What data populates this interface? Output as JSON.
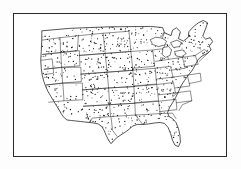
{
  "figure": {
    "title": "Dot density map of the contiguous United States",
    "style": "black-and-white line engraving",
    "background_color": "#ffffff",
    "ink_color": "#1a1a1a",
    "frame": {
      "present": true,
      "border_color": "#2b2b2b",
      "border_width_px": 1.3,
      "x": 13,
      "y": 13,
      "width": 214,
      "height": 144
    }
  },
  "map": {
    "region": "Contiguous United States (lower 48)",
    "projection_hint": "Albers-like conic",
    "features": {
      "state_boundaries": true,
      "national_outline": true,
      "great_lakes": true,
      "dot_density_fill": true,
      "labels": false,
      "legend": false,
      "scale_bar": false,
      "compass_rose": false
    },
    "dot_symbol": {
      "shape": "dot",
      "radius_px": 0.55,
      "color": "#1a1a1a",
      "approx_count": 1180,
      "distribution": "roughly uniform scatter within land area"
    },
    "outline_color": "#1a1a1a",
    "outline_width_px": 0.7,
    "state_line_width_px": 0.5,
    "nation_outline_path": "M 28.5 17.0 L 57.0 14.5 L 96.0 13.0 L 138.0 12.6 L 150.0 13.8 L 152.0 19.0 L 158.5 22.0 L 160.0 16.5 L 164.0 14.0 L 168.0 18.0 L 166.0 25.0 L 171.0 27.5 L 176.0 23.5 L 176.5 18.0 L 181.0 13.0 L 186.0 9.0 L 191.0 6.5 L 195.5 9.0 L 193.0 16.0 L 190.5 22.5 L 193.5 25.5 L 198.0 24.0 L 200.5 28.0 L 197.0 32.5 L 199.0 36.5 L 195.0 40.0 L 190.0 42.5 L 186.0 46.0 L 183.0 51.5 L 180.0 57.0 L 176.0 62.0 L 172.0 67.5 L 168.5 73.0 L 166.0 79.0 L 163.0 85.0 L 160.0 90.0 L 157.0 95.0 L 155.0 100.0 L 156.5 104.0 L 160.0 106.0 L 163.5 110.0 L 166.0 116.0 L 167.5 123.0 L 168.0 130.0 L 166.0 134.5 L 162.5 133.0 L 160.0 128.0 L 158.0 121.0 L 155.5 115.0 L 152.0 111.0 L 147.5 110.0 L 142.0 110.5 L 136.0 111.5 L 130.0 112.0 L 124.5 112.0 L 120.0 113.5 L 116.0 117.0 L 112.0 120.0 L 108.0 122.5 L 104.5 125.0 L 101.0 128.0 L 98.0 131.5 L 95.5 128.0 L 93.0 123.0 L 91.0 118.0 L 88.5 114.0 L 85.0 111.5 L 80.5 110.5 L 76.0 110.0 L 71.5 109.5 L 67.0 109.0 L 62.5 108.5 L 58.0 108.0 L 53.5 107.5 L 49.5 104.0 L 46.5 99.0 L 43.5 94.0 L 40.5 89.0 L 37.5 84.0 L 34.5 79.0 L 32.0 73.5 L 30.0 68.0 L 28.5 62.0 L 27.5 55.0 L 27.0 47.0 L 27.5 38.0 L 28.0 27.0 Z",
    "state_lines": [
      "M 28.2 26.5 L 46.5 24.0 L 47.0 39.0 L 29.0 41.0",
      "M 47.0 39.0 L 64.0 37.0 L 65.0 22.0 L 46.5 24.0",
      "M 29.0 41.0 L 47.3 39.2 L 48.0 54.0 L 30.5 56.0",
      "M 48.0 54.0 L 66.5 52.5 L 66.0 37.2 L 47.3 39.2",
      "M 65.0 22.0 L 90.0 19.5 L 92.0 40.0 L 66.0 42.0",
      "M 90.0 19.5 L 116.0 17.5 L 118.0 38.0 L 92.0 40.0",
      "M 92.0 40.0 L 118.0 38.0 L 120.0 57.0 L 94.0 59.0",
      "M 66.0 42.0 L 92.0 40.0 L 94.0 59.0 L 67.5 61.0",
      "M 30.5 56.0 L 48.2 54.2 L 49.0 70.0 L 32.5 72.0",
      "M 49.0 70.0 L 68.0 68.5 L 67.5 54.0 L 48.2 54.2",
      "M 67.5 61.0 L 94.0 59.0 L 95.5 75.0 L 69.0 77.0",
      "M 95.5 75.0 L 121.0 73.5 L 120.0 57.2 L 94.0 59.0",
      "M 32.5 72.0 L 49.3 70.2 L 50.5 88.0 L 35.0 89.5",
      "M 50.5 88.0 L 69.5 87.0 L 69.0 70.0 L 49.3 70.2",
      "M 69.0 77.0 L 95.5 75.0 L 96.5 92.0 L 70.0 93.5",
      "M 96.5 92.0 L 122.0 90.5 L 121.0 73.7 L 95.5 75.0",
      "M 70.0 93.5 L 96.5 92.0 L 97.5 104.0 L 79.0 105.5 L 76.0 110.0",
      "M 97.5 104.0 L 122.5 102.5 L 122.0 90.5 L 96.5 92.0",
      "M 118.0 38.0 L 140.0 36.5 L 142.0 53.0 L 120.0 55.0",
      "M 120.0 57.0 L 142.5 55.0 L 144.0 71.0 L 121.0 73.0",
      "M 121.0 73.5 L 144.0 71.5 L 146.0 88.0 L 122.0 90.0",
      "M 122.0 90.5 L 146.0 88.5 L 147.5 101.0 L 122.5 102.5",
      "M 140.0 36.5 L 152.0 35.0 L 156.0 46.0 L 143.0 48.0",
      "M 142.5 55.0 L 158.0 53.0 L 160.5 64.0 L 144.0 66.0",
      "M 144.0 71.5 L 161.0 69.5 L 163.0 80.0 L 146.0 82.0",
      "M 146.0 88.5 L 163.5 86.5 L 164.5 97.0 L 147.0 99.0",
      "M 156.0 46.0 L 170.0 44.0 L 173.0 55.0 L 158.5 57.0",
      "M 160.5 64.0 L 175.0 62.0 L 177.5 73.0 L 162.5 75.0",
      "M 163.0 80.0 L 178.0 78.0 L 179.5 88.0 L 164.0 90.0",
      "M 170.0 44.0 L 183.0 42.0 L 186.0 51.0 L 172.0 53.5",
      "M 175.0 62.0 L 188.0 60.0 L 189.0 68.0 L 177.0 70.5",
      "M 183.0 42.0 L 192.0 36.0 L 196.5 39.0 L 187.0 48.0",
      "M 147.5 101.0 L 160.0 100.5 L 163.5 106.0",
      "M 98.0 105.0 L 99.5 118.0 L 104.0 124.0",
      "M 122.5 102.5 L 130.0 112.0",
      "M 152.0 19.0 L 149.0 26.0 L 152.5 31.0 L 151.0 35.5",
      "M 27.5 47.0 L 38.5 45.5 L 40.0 60.0 L 31.0 61.5",
      "M 166.0 79.0 L 160.0 84.0",
      "M 179.5 88.0 L 170.0 92.0 L 166.5 98.0"
    ],
    "great_lakes_path": "M 137.5 26.0 L 143.0 23.5 L 149.5 24.5 L 154.0 27.5 L 152.0 31.5 L 146.0 33.0 L 140.0 31.0 Z M 150.5 34.0 L 156.0 33.0 L 159.0 36.5 L 157.5 42.0 L 153.0 44.0 L 149.5 41.0 Z M 158.0 29.0 L 164.5 26.5 L 169.0 29.0 L 167.0 33.0 L 161.0 34.0 Z M 162.0 38.0 L 170.0 36.5 L 174.0 40.0 L 169.0 43.5 L 163.5 42.5 Z"
  },
  "annotations": {
    "text_labels": [],
    "note": "No text, legend, axis, or caption appears inside the image."
  }
}
